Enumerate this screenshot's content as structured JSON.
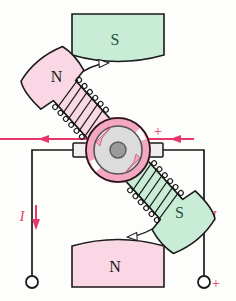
{
  "figure": {
    "background_color": "#fdfdfb",
    "ink_color": "#1a1a1a",
    "current_color": "#e8356d",
    "labels": {
      "stator_top": "S",
      "stator_bottom": "N",
      "rotor_upper": "N",
      "rotor_lower": "S",
      "current_left": "I",
      "current_right": "I",
      "plus_brush": "+",
      "plus_terminal": "+"
    },
    "colors": {
      "green_fill": "#c9ecd7",
      "green_stroke": "#2d6b45",
      "pink_fill": "#f9d7e4",
      "pink_stroke": "#c8566f",
      "rotor_ring_fill": "#f4a7c0",
      "rotor_core_fill": "#dcdcdc",
      "rotor_hub_fill": "#9a9a9a",
      "brush_fill": "#eeeeee",
      "wire_color": "#1a1a1a"
    },
    "elements": {
      "stator_top_pole": "upper field magnet pole marked S, green",
      "stator_bottom_pole": "lower field magnet pole marked N, pink",
      "rotor_upper_arm": "upper-right armature pole piece marked N, pink, wound with coil",
      "rotor_lower_arm": "lower-left armature pole piece marked S, green, wound with coil",
      "commutator": "split-ring commutator at centre with shaft hub",
      "brush_left": "left carbon brush",
      "brush_right": "right carbon brush",
      "terminal_left": "left output terminal, open circle",
      "terminal_right": "right output terminal, open circle, positive",
      "rotation_arrow_top": "hollow arrow showing rotation direction, points right",
      "rotation_arrow_bottom": "hollow arrow showing rotation direction, points left",
      "current_arrow_left_wire": "downward current arrow on left lead",
      "current_arrow_right_wire": "upward current arrow on right lead",
      "current_arrow_left_brush": "leftward current arrow above left brush lead",
      "current_arrow_right_brush": "leftward current arrow above right brush lead"
    }
  }
}
